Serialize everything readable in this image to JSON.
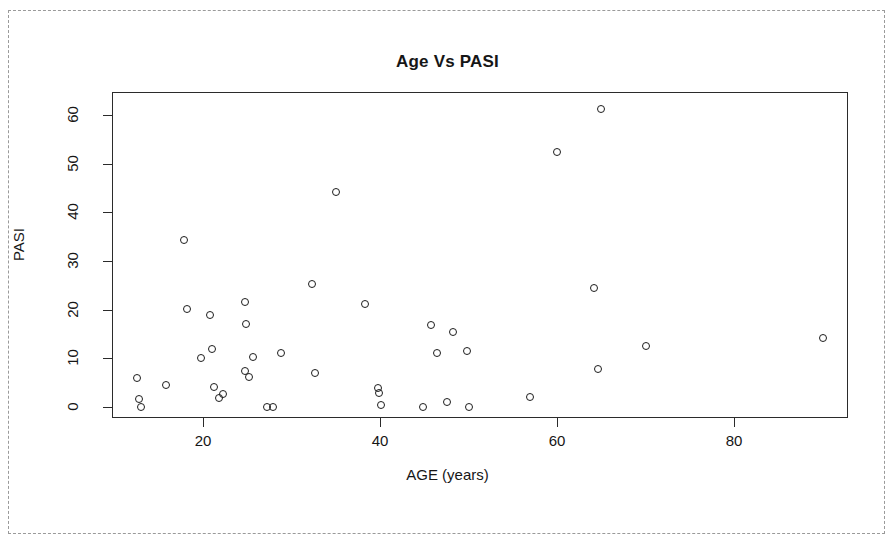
{
  "figure": {
    "title": "Age Vs PASI",
    "xlabel": "AGE (years)",
    "ylabel": "PASI"
  },
  "axes": {
    "x_ticks": [
      "20",
      "40",
      "60",
      "80"
    ],
    "y_ticks": [
      "0",
      "10",
      "20",
      "30",
      "40",
      "50",
      "60"
    ]
  },
  "colors": {
    "marker_stroke": "#1d1d1d",
    "frame": "#2b2b2b",
    "scan_border": "#9a9a9a",
    "text": "#161616"
  },
  "chart_data": {
    "type": "scatter",
    "title": "Age Vs PASI",
    "xlabel": "AGE (years)",
    "ylabel": "PASI",
    "xlim": [
      10,
      93
    ],
    "ylim": [
      -2,
      65
    ],
    "grid": false,
    "legend": null,
    "marker": "open-circle",
    "series": [
      {
        "name": "patients",
        "points": [
          [
            12.5,
            6.0
          ],
          [
            12.8,
            1.6
          ],
          [
            13.0,
            0.0
          ],
          [
            15.8,
            4.6
          ],
          [
            17.8,
            34.2
          ],
          [
            18.2,
            20.2
          ],
          [
            19.8,
            10.0
          ],
          [
            20.8,
            18.8
          ],
          [
            21.0,
            12.0
          ],
          [
            21.2,
            4.2
          ],
          [
            21.8,
            1.8
          ],
          [
            22.3,
            2.6
          ],
          [
            24.7,
            21.6
          ],
          [
            24.9,
            17.0
          ],
          [
            24.8,
            7.4
          ],
          [
            25.2,
            6.2
          ],
          [
            25.6,
            10.2
          ],
          [
            27.2,
            0.0
          ],
          [
            27.9,
            0.0
          ],
          [
            28.8,
            11.0
          ],
          [
            32.3,
            25.3
          ],
          [
            32.6,
            7.0
          ],
          [
            35.0,
            44.2
          ],
          [
            38.3,
            21.2
          ],
          [
            39.8,
            4.0
          ],
          [
            39.9,
            2.8
          ],
          [
            40.1,
            0.4
          ],
          [
            44.9,
            0.0
          ],
          [
            45.8,
            16.8
          ],
          [
            46.4,
            11.0
          ],
          [
            47.6,
            1.0
          ],
          [
            48.3,
            15.4
          ],
          [
            49.8,
            11.4
          ],
          [
            50.1,
            0.0
          ],
          [
            56.9,
            2.0
          ],
          [
            60.0,
            52.4
          ],
          [
            64.2,
            24.4
          ],
          [
            64.6,
            7.8
          ],
          [
            65.0,
            61.2
          ],
          [
            70.0,
            12.6
          ],
          [
            90.0,
            14.2
          ]
        ]
      }
    ]
  }
}
